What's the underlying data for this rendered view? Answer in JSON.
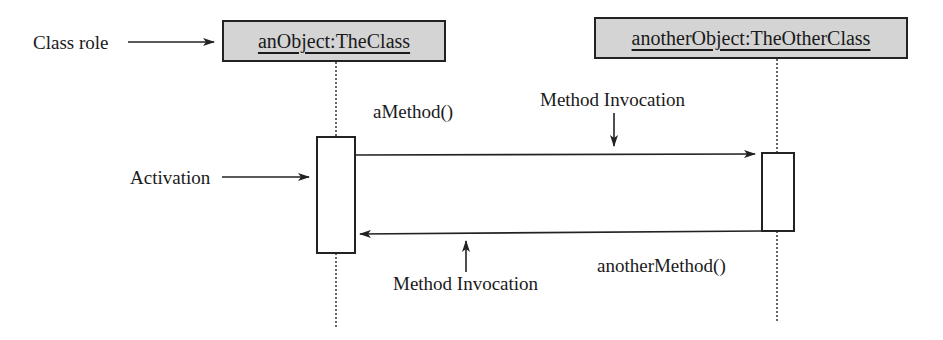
{
  "diagram": {
    "type": "UML sequence diagram",
    "objects": [
      {
        "id": "left",
        "label": "anObject:TheClass"
      },
      {
        "id": "right",
        "label": "anotherObject:TheOtherClass"
      }
    ],
    "annotations": {
      "class_role": "Class role",
      "activation": "Activation",
      "method_invocation_top": "Method Invocation",
      "method_invocation_bottom": "Method Invocation"
    },
    "messages": [
      {
        "from": "left",
        "to": "right",
        "label": "aMethod()"
      },
      {
        "from": "right",
        "to": "left",
        "label": "anotherMethod()"
      }
    ],
    "colors": {
      "object_fill": "#d4d4d4",
      "line": "#222222"
    }
  }
}
